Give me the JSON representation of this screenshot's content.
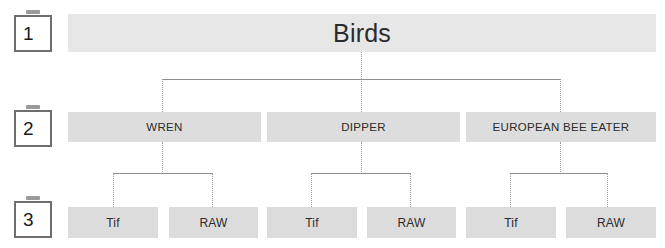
{
  "diagram": {
    "title_node": {
      "label": "Birds"
    },
    "levels": [
      {
        "number": "1"
      },
      {
        "number": "2"
      },
      {
        "number": "3"
      }
    ],
    "level_2_nodes": [
      {
        "label": "WREN"
      },
      {
        "label": "DIPPER"
      },
      {
        "label": "EUROPEAN BEE EATER"
      }
    ],
    "level_3_nodes": [
      {
        "label": "Tif"
      },
      {
        "label": "RAW"
      },
      {
        "label": "Tif"
      },
      {
        "label": "RAW"
      },
      {
        "label": "Tif"
      },
      {
        "label": "RAW"
      }
    ],
    "colors": {
      "level_1_bar": "#e7e7e7",
      "level_2_bar": "#dddddd",
      "level_3_bar": "#dcdcdc",
      "badge_border": "#6e6e6e",
      "badge_tab": "#9a9a9a",
      "connector_line": "#8d8d8d",
      "connector_dotted": "#9b9b9b",
      "text": "#2b2b2b",
      "background": "#ffffff"
    }
  }
}
